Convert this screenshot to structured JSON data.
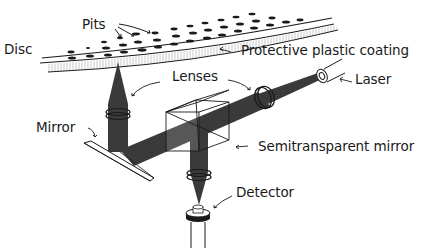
{
  "diagram": {
    "type": "optical-schematic",
    "colors": {
      "background": "#ffffff",
      "ink": "#1a1a1a",
      "beam": "#3a3a3a",
      "beam_focus": "#2a2a2a"
    },
    "labels": {
      "disc": "Disc",
      "pits": "Pits",
      "coating": "Protective plastic coating",
      "lenses": "Lenses",
      "laser": "Laser",
      "mirror": "Mirror",
      "semi_mirror": "Semitransparent mirror",
      "detector": "Detector"
    },
    "components": [
      {
        "id": "disc",
        "label": "Disc"
      },
      {
        "id": "pits",
        "label": "Pits"
      },
      {
        "id": "protective-coating",
        "label": "Protective plastic coating"
      },
      {
        "id": "laser",
        "label": "Laser"
      },
      {
        "id": "lens-laser",
        "label": "Lenses"
      },
      {
        "id": "lens-disc",
        "label": "Lenses"
      },
      {
        "id": "lens-detector",
        "label": ""
      },
      {
        "id": "semitransparent-mirror",
        "label": "Semitransparent mirror"
      },
      {
        "id": "mirror",
        "label": "Mirror"
      },
      {
        "id": "detector",
        "label": "Detector"
      }
    ],
    "beam_path": [
      "laser",
      "lens-laser",
      "semitransparent-mirror",
      "mirror",
      "lens-disc",
      "disc",
      "lens-disc",
      "mirror",
      "semitransparent-mirror",
      "lens-detector",
      "detector"
    ]
  }
}
